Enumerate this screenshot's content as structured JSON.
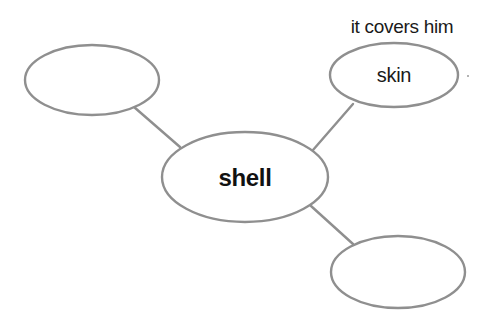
{
  "diagram": {
    "type": "concept-map",
    "stroke_color": "#8f8f8f",
    "center_node": {
      "label": "shell",
      "cx": 245,
      "cy": 177,
      "rx": 83,
      "ry": 45
    },
    "nodes": [
      {
        "id": "top-left",
        "label": "",
        "cx": 92,
        "cy": 80,
        "rx": 67,
        "ry": 35
      },
      {
        "id": "top-right",
        "label": "skin",
        "annotation": "it covers him",
        "cx": 394,
        "cy": 75,
        "rx": 64,
        "ry": 32
      },
      {
        "id": "bottom-right",
        "label": "",
        "cx": 398,
        "cy": 272,
        "rx": 67,
        "ry": 36
      }
    ],
    "connectors": [
      {
        "from": "top-left",
        "to": "center",
        "x1": 134,
        "y1": 107,
        "x2": 180,
        "y2": 147
      },
      {
        "from": "top-right",
        "to": "center",
        "x1": 353,
        "y1": 104,
        "x2": 313,
        "y2": 150
      },
      {
        "from": "bottom-right",
        "to": "center",
        "x1": 353,
        "y1": 244,
        "x2": 311,
        "y2": 206
      }
    ]
  }
}
